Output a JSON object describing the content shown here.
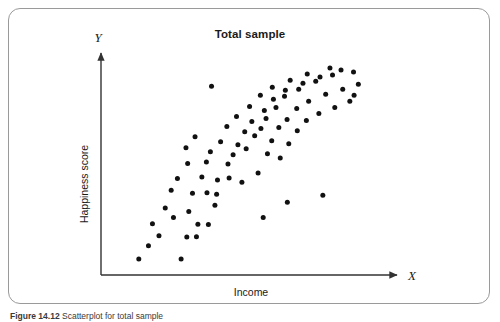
{
  "figure": {
    "title": "Total sample",
    "caption_label": "Figure 14.12",
    "caption_text": "Scatterplot  for  total  sample",
    "frame_color": "#9a9a9a",
    "point_color": "#111111",
    "axis_color": "#333333"
  },
  "chart_data": {
    "type": "scatter",
    "title": "Total sample",
    "xlabel": "Income",
    "ylabel": "Happiness score",
    "x_axis_letter": "X",
    "y_axis_letter": "Y",
    "grid": false,
    "legend": "none",
    "ticks": [],
    "xlim": [
      0,
      100
    ],
    "ylim": [
      0,
      100
    ],
    "n_points": 79,
    "points": [
      [
        11.2,
        5.0
      ],
      [
        26.1,
        5.0
      ],
      [
        14.6,
        11.5
      ],
      [
        18.3,
        16.5
      ],
      [
        28.1,
        15.8
      ],
      [
        31.5,
        16.0
      ],
      [
        16.0,
        22.4
      ],
      [
        23.4,
        25.5
      ],
      [
        32.0,
        22.2
      ],
      [
        35.7,
        22.0
      ],
      [
        20.5,
        30.2
      ],
      [
        28.8,
        28.5
      ],
      [
        38.0,
        31.5
      ],
      [
        22.6,
        39.0
      ],
      [
        30.1,
        37.5
      ],
      [
        35.2,
        37.8
      ],
      [
        38.6,
        37.0
      ],
      [
        24.8,
        44.8
      ],
      [
        33.4,
        45.5
      ],
      [
        38.9,
        44.0
      ],
      [
        43.0,
        45.0
      ],
      [
        28.4,
        52.2
      ],
      [
        35.0,
        53.0
      ],
      [
        42.6,
        52.0
      ],
      [
        47.5,
        43.0
      ],
      [
        27.8,
        60.0
      ],
      [
        36.4,
        58.0
      ],
      [
        44.4,
        56.5
      ],
      [
        49.0,
        59.5
      ],
      [
        53.2,
        47.5
      ],
      [
        31.0,
        65.5
      ],
      [
        40.0,
        63.0
      ],
      [
        46.1,
        61.5
      ],
      [
        52.0,
        66.0
      ],
      [
        56.5,
        57.0
      ],
      [
        42.2,
        70.5
      ],
      [
        48.5,
        68.0
      ],
      [
        54.2,
        69.5
      ],
      [
        58.0,
        63.5
      ],
      [
        61.0,
        55.0
      ],
      [
        45.6,
        75.5
      ],
      [
        51.0,
        73.0
      ],
      [
        56.0,
        74.5
      ],
      [
        60.5,
        70.0
      ],
      [
        64.0,
        62.0
      ],
      [
        50.2,
        80.5
      ],
      [
        55.4,
        78.5
      ],
      [
        59.5,
        80.0
      ],
      [
        63.4,
        74.0
      ],
      [
        67.0,
        68.5
      ],
      [
        54.0,
        86.0
      ],
      [
        58.6,
        84.0
      ],
      [
        62.5,
        85.5
      ],
      [
        66.8,
        79.5
      ],
      [
        70.2,
        73.5
      ],
      [
        58.2,
        90.0
      ],
      [
        62.8,
        88.5
      ],
      [
        67.5,
        89.0
      ],
      [
        71.0,
        83.0
      ],
      [
        74.6,
        77.0
      ],
      [
        64.5,
        93.5
      ],
      [
        69.0,
        92.0
      ],
      [
        73.5,
        93.0
      ],
      [
        77.0,
        86.5
      ],
      [
        80.2,
        80.0
      ],
      [
        70.5,
        96.5
      ],
      [
        75.0,
        95.0
      ],
      [
        79.4,
        96.0
      ],
      [
        83.0,
        89.0
      ],
      [
        85.5,
        83.0
      ],
      [
        78.5,
        99.5
      ],
      [
        82.4,
        98.5
      ],
      [
        86.8,
        97.5
      ],
      [
        88.5,
        91.5
      ],
      [
        87.0,
        86.0
      ],
      [
        36.8,
        90.5
      ],
      [
        55.0,
        25.5
      ],
      [
        63.5,
        33.0
      ],
      [
        76.0,
        36.5
      ]
    ]
  }
}
